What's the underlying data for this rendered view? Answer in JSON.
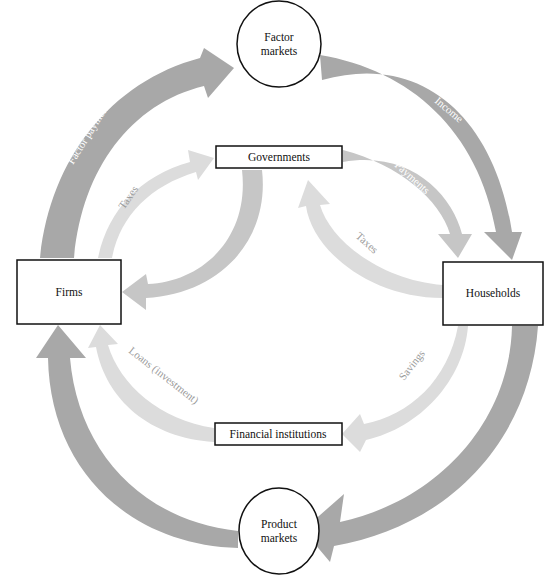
{
  "diagram": {
    "type": "circular-flow",
    "nodes": {
      "factor_markets": {
        "line1": "Factor",
        "line2": "markets",
        "shape": "circle"
      },
      "product_markets": {
        "line1": "Product",
        "line2": "markets",
        "shape": "circle"
      },
      "governments": {
        "label": "Governments",
        "shape": "box"
      },
      "firms": {
        "label": "Firms",
        "shape": "box"
      },
      "households": {
        "label": "Households",
        "shape": "box"
      },
      "financial_institutions": {
        "label": "Financial institutions",
        "shape": "box"
      }
    },
    "flows": {
      "factor_payments": {
        "label": "Factor payments",
        "from": "Firms",
        "to": "Factor markets"
      },
      "income": {
        "label": "Income",
        "from": "Factor markets",
        "to": "Households"
      },
      "consumption_expenditure": {
        "label": "Consumption expenditure",
        "from": "Households",
        "to": "Product markets"
      },
      "sales_receipts": {
        "label": "Sales receipts",
        "from": "Product markets",
        "to": "Firms"
      },
      "firm_taxes": {
        "label": "Taxes",
        "from": "Firms",
        "to": "Governments"
      },
      "gov_payments_firms": {
        "label": "Payments",
        "from": "Governments",
        "to": "Firms"
      },
      "gov_payments_households": {
        "label": "Payments",
        "from": "Governments",
        "to": "Households"
      },
      "household_taxes": {
        "label": "Taxes",
        "from": "Households",
        "to": "Governments"
      },
      "savings": {
        "label": "Savings",
        "from": "Households",
        "to": "Financial institutions"
      },
      "loans": {
        "label": "Loans (investment)",
        "from": "Financial institutions",
        "to": "Firms"
      }
    },
    "colors": {
      "main_flow": "#a8a8a8",
      "government_flow": "#c6c6c6",
      "light_flow": "#dcdcdc",
      "outline": "#111111",
      "background": "#ffffff"
    }
  }
}
